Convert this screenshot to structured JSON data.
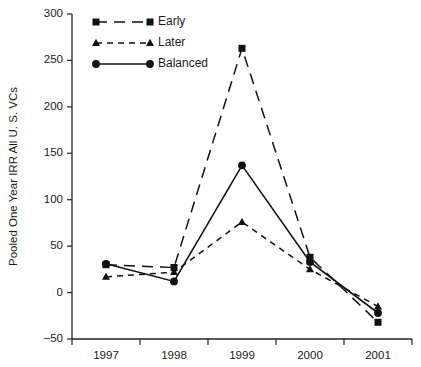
{
  "chart_data": {
    "type": "line",
    "title": "",
    "xlabel": "",
    "ylabel": "Pooled One Year IRR All U. S. VCs",
    "categories": [
      "1997",
      "1998",
      "1999",
      "2000",
      "2001"
    ],
    "ylim": [
      -50,
      300
    ],
    "yticks": [
      -50,
      0,
      50,
      100,
      150,
      200,
      250,
      300
    ],
    "ytick_labels": [
      "−50",
      "0",
      "50",
      "100",
      "150",
      "200",
      "250",
      "300"
    ],
    "grid": false,
    "legend_position": "top-left",
    "series": [
      {
        "name": "Early",
        "marker": "square",
        "linestyle": "long-dash",
        "color": "#111111",
        "values": [
          30,
          27,
          263,
          38,
          -32
        ]
      },
      {
        "name": "Later",
        "marker": "triangle",
        "linestyle": "short-dash",
        "color": "#111111",
        "values": [
          17,
          22,
          76,
          25,
          -15
        ]
      },
      {
        "name": "Balanced",
        "marker": "circle",
        "linestyle": "solid",
        "color": "#111111",
        "values": [
          31,
          12,
          137,
          33,
          -22
        ]
      }
    ]
  },
  "legend": {
    "items": [
      {
        "label": "Early"
      },
      {
        "label": "Later"
      },
      {
        "label": "Balanced"
      }
    ]
  }
}
